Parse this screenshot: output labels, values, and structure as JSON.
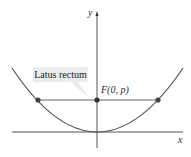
{
  "diagram": {
    "axes": {
      "x_label": "x",
      "y_label": "y"
    },
    "focus_label": "F(0, p)",
    "callout_label": "Latus rectum",
    "colors": {
      "curve": "#555555",
      "axes": "#555555",
      "point": "#444444",
      "callout_bg": "#ececec"
    }
  }
}
